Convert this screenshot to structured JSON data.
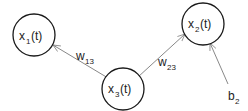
{
  "nodes": [
    {
      "id": "x1",
      "var": "x",
      "sub": "1",
      "arg": "(t)"
    },
    {
      "id": "x2",
      "var": "x",
      "sub": "2",
      "arg": "(t)"
    },
    {
      "id": "x3",
      "var": "x",
      "sub": "3",
      "arg": "(t)"
    }
  ],
  "edges": [
    {
      "from": "x3",
      "to": "x1",
      "label_var": "w",
      "label_sub": "13"
    },
    {
      "from": "x3",
      "to": "x2",
      "label_var": "w",
      "label_sub": "23"
    },
    {
      "from": "b2",
      "to": "x2",
      "label_var": "b",
      "label_sub": "2"
    }
  ],
  "colors": {
    "node_stroke": "#1a1a1a",
    "edge_stroke": "#7a7a7a",
    "text": "#222222"
  }
}
